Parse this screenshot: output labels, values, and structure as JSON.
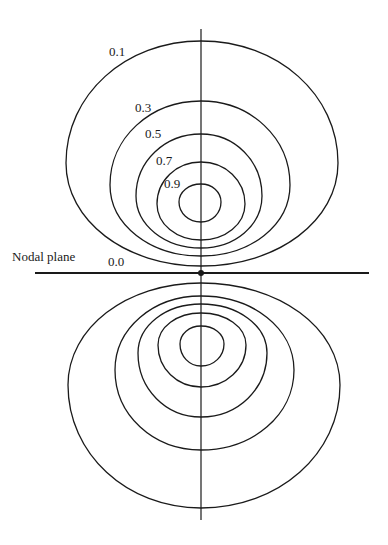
{
  "figure": {
    "type": "contour-diagram",
    "colors": {
      "ink": "#1a1a1a",
      "background": "#ffffff"
    },
    "axis": {
      "x": 201,
      "y_top": 29,
      "y_bottom": 520
    },
    "nodal_plane": {
      "label": "Nodal plane",
      "value_label": "0.0",
      "y": 273,
      "x_start": 35,
      "x_end": 369,
      "center_dot": {
        "x": 201,
        "y": 273
      }
    },
    "lobes": {
      "upper": [
        {
          "value": "0.1",
          "top": 41,
          "bottom": 266,
          "left": 66,
          "right": 338,
          "wide_y": 163
        },
        {
          "value": "0.3",
          "top": 101,
          "bottom": 256,
          "left": 110,
          "right": 290,
          "wide_y": 185
        },
        {
          "value": "0.5",
          "top": 134,
          "bottom": 248,
          "left": 136,
          "right": 262,
          "wide_y": 196
        },
        {
          "value": "0.7",
          "top": 162,
          "bottom": 240,
          "left": 157,
          "right": 245,
          "wide_y": 204
        },
        {
          "value": "0.9",
          "top": 184,
          "bottom": 222,
          "left": 179,
          "right": 221,
          "wide_y": 202
        }
      ],
      "lower": [
        {
          "value": "0.1",
          "top": 283,
          "bottom": 508,
          "left": 68,
          "right": 340,
          "wide_y": 385
        },
        {
          "value": "0.3",
          "top": 296,
          "bottom": 450,
          "left": 115,
          "right": 294,
          "wide_y": 370
        },
        {
          "value": "0.5",
          "top": 304,
          "bottom": 417,
          "left": 138,
          "right": 267,
          "wide_y": 353
        },
        {
          "value": "0.7",
          "top": 313,
          "bottom": 387,
          "left": 158,
          "right": 246,
          "wide_y": 345
        },
        {
          "value": "0.9",
          "top": 326,
          "bottom": 366,
          "left": 180,
          "right": 224,
          "wide_y": 344
        }
      ]
    },
    "labels": [
      {
        "id": "label-0-1",
        "text": "0.1",
        "x": 109,
        "y": 56
      },
      {
        "id": "label-0-3",
        "text": "0.3",
        "x": 135,
        "y": 112
      },
      {
        "id": "label-0-5",
        "text": "0.5",
        "x": 145,
        "y": 138
      },
      {
        "id": "label-0-7",
        "text": "0.7",
        "x": 156,
        "y": 165
      },
      {
        "id": "label-0-9",
        "text": "0.9",
        "x": 164,
        "y": 188
      },
      {
        "id": "label-nodal-plane",
        "text": "Nodal plane",
        "x": 12,
        "y": 261
      },
      {
        "id": "label-0-0",
        "text": "0.0",
        "x": 108,
        "y": 266
      }
    ]
  }
}
